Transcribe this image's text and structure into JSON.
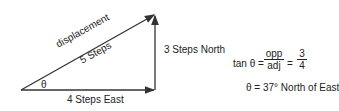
{
  "diagram": {
    "hypotenuse_label_1": "displacement",
    "hypotenuse_label_2": "5 Steps",
    "angle_label": "θ",
    "base_label": "4 Steps East",
    "side_label": "3 Steps North",
    "equation": {
      "lhs": "tan θ =",
      "frac1_num": "opp",
      "frac1_den": "adj",
      "eq2": "=",
      "frac2_num": "3",
      "frac2_den": "4"
    },
    "result": "θ = 37° North of East"
  }
}
